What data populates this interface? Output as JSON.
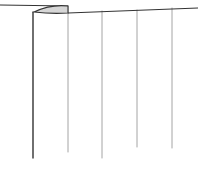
{
  "diagram": {
    "type": "line-sketch",
    "background": "#ffffff",
    "stroke_color": "#333333",
    "light_stroke_color": "#9a9a9a",
    "fill_color": "#d6d6d6",
    "rail": {
      "left_segment": {
        "x1": 0,
        "y1": 5,
        "x2": 68,
        "y2": 6
      },
      "main_segment": {
        "x1": 68,
        "y1": 13,
        "x2": 198,
        "y2": 8
      }
    },
    "bracket": {
      "x": 34,
      "y": 6,
      "width": 34,
      "height": 7
    },
    "verticals": [
      {
        "x": 33,
        "y1": 12,
        "y2": 158,
        "weight": "heavy"
      },
      {
        "x": 68,
        "y1": 6,
        "y2": 152,
        "weight": "light"
      },
      {
        "x": 102,
        "y1": 11,
        "y2": 158,
        "weight": "light"
      },
      {
        "x": 137,
        "y1": 10,
        "y2": 147,
        "weight": "light"
      },
      {
        "x": 172,
        "y1": 8,
        "y2": 148,
        "weight": "light"
      }
    ]
  }
}
